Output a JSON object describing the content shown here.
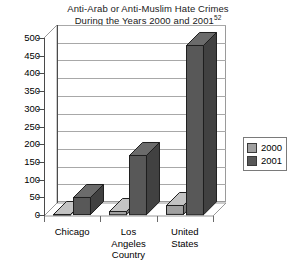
{
  "chart_data": {
    "type": "bar",
    "title": "Anti-Arab or Anti-Muslim Hate Crimes During the Years 2000 and 2001",
    "title_line1": "Anti-Arab or Anti-Muslim Hate Crimes",
    "title_line2": "During the Years 2000 and 2001",
    "title_footnote": "52",
    "xlabel": "",
    "ylabel": "",
    "ylim": [
      0,
      500
    ],
    "ytick_step": 50,
    "grid": true,
    "legend_position": "right",
    "style": "3d-column",
    "categories": [
      "Chicago",
      "Los Angeles Country",
      "United States"
    ],
    "category_lines": [
      [
        "Chicago"
      ],
      [
        "Los",
        "Angeles",
        "Country"
      ],
      [
        "United",
        "States"
      ]
    ],
    "yticks": [
      500,
      450,
      400,
      350,
      300,
      250,
      200,
      150,
      100,
      50,
      0
    ],
    "series": [
      {
        "name": "2000",
        "color": "#a0a0a0",
        "values": [
          4,
          12,
          28
        ]
      },
      {
        "name": "2001",
        "color": "#585858",
        "values": [
          51,
          170,
          481
        ]
      }
    ]
  },
  "legend": {
    "items": [
      {
        "label": "2000",
        "color": "#a0a0a0"
      },
      {
        "label": "2001",
        "color": "#585858"
      }
    ]
  },
  "colors": {
    "series_2000": "#a0a0a0",
    "series_2001": "#585858",
    "gridline": "#a8a8a8",
    "axis": "#4a4a4a",
    "background": "#ffffff",
    "text": "#000000"
  }
}
